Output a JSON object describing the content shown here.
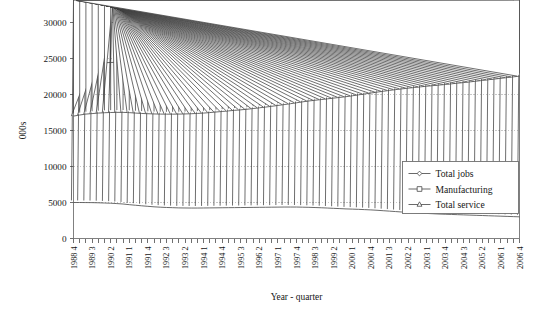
{
  "chart_data": {
    "type": "line",
    "title": "",
    "xlabel": "Year - quarter",
    "ylabel": "000s",
    "ylim": [
      0,
      30000
    ],
    "yticks": [
      0,
      5000,
      10000,
      15000,
      20000,
      25000,
      30000
    ],
    "ytick_labels": [
      "0",
      "5000",
      "10000",
      "15000",
      "20000",
      "25000",
      "30000"
    ],
    "grid": true,
    "legend_position": "center-right",
    "x": [
      "1988 4",
      "1989 1",
      "1989 2",
      "1989 3",
      "1989 4",
      "1990 1",
      "1990 2",
      "1990 3",
      "1990 4",
      "1991 1",
      "1991 2",
      "1991 3",
      "1991 4",
      "1992 1",
      "1992 2",
      "1992 3",
      "1992 4",
      "1993 1",
      "1993 2",
      "1993 3",
      "1993 4",
      "1994 1",
      "1994 2",
      "1994 3",
      "1994 4",
      "1995 1",
      "1995 2",
      "1995 3",
      "1995 4",
      "1996 1",
      "1996 2",
      "1996 3",
      "1996 4",
      "1997 1",
      "1997 2",
      "1997 3",
      "1997 4",
      "1998 1",
      "1998 2",
      "1998 3",
      "1998 4",
      "1999 1",
      "1999 2",
      "1999 3",
      "1999 4",
      "2000 1",
      "2000 2",
      "2000 3",
      "2000 4",
      "2001 1",
      "2001 2",
      "2001 3",
      "2001 4",
      "2002 1",
      "2002 2",
      "2002 3",
      "2002 4",
      "2003 1",
      "2003 2",
      "2003 3",
      "2003 4",
      "2004 1",
      "2004 2",
      "2004 3",
      "2004 4",
      "2005 1",
      "2005 2",
      "2005 3",
      "2005 4",
      "2006 1",
      "2006 2",
      "2006 3",
      "2006 4"
    ],
    "xtick_labels": [
      "1988 4",
      "1989 3",
      "1990 2",
      "1991 1",
      "1991 4",
      "1992 3",
      "1993 2",
      "1994 1",
      "1994 4",
      "1995 3",
      "1996 2",
      "1997 1",
      "1997 4",
      "1998 3",
      "1999 2",
      "2000 1",
      "2000 4",
      "2001 3",
      "2002 2",
      "2003 1",
      "2003 4",
      "2004 3",
      "2005 2",
      "2006 1",
      "2006 4"
    ],
    "xtick_indices": [
      0,
      3,
      6,
      9,
      12,
      15,
      18,
      21,
      24,
      27,
      30,
      33,
      36,
      39,
      42,
      45,
      48,
      51,
      54,
      57,
      60,
      63,
      66,
      69,
      72
    ],
    "series": [
      {
        "name": "Total jobs",
        "marker": "diamond",
        "values": [
          23900,
          24050,
          24180,
          24270,
          24330,
          24400,
          24450,
          24470,
          24430,
          24330,
          24150,
          23950,
          23750,
          23550,
          23380,
          23230,
          23130,
          23050,
          23030,
          23060,
          23100,
          23150,
          23220,
          23300,
          23350,
          23400,
          23450,
          23480,
          23520,
          23580,
          23650,
          23720,
          23800,
          23900,
          24030,
          24150,
          24280,
          24400,
          24500,
          24580,
          24650,
          24700,
          24760,
          24820,
          24900,
          25000,
          25120,
          25230,
          25350,
          25480,
          25600,
          25720,
          25820,
          25900,
          25980,
          26050,
          26120,
          26180,
          26230,
          26280,
          26330,
          26400,
          26480,
          26570,
          26650,
          26750,
          26850,
          26950,
          27050,
          27150,
          27250,
          27350,
          27450
        ]
      },
      {
        "name": "Manufacturing",
        "marker": "square",
        "values": [
          5000,
          5000,
          4990,
          4980,
          4960,
          4930,
          4900,
          4850,
          4790,
          4700,
          4620,
          4540,
          4470,
          4400,
          4350,
          4310,
          4280,
          4250,
          4240,
          4230,
          4230,
          4240,
          4250,
          4260,
          4270,
          4280,
          4290,
          4300,
          4310,
          4320,
          4330,
          4340,
          4350,
          4360,
          4370,
          4370,
          4370,
          4350,
          4330,
          4300,
          4270,
          4230,
          4190,
          4150,
          4110,
          4080,
          4050,
          4010,
          3970,
          3920,
          3860,
          3800,
          3740,
          3680,
          3620,
          3570,
          3530,
          3480,
          3440,
          3400,
          3370,
          3340,
          3310,
          3280,
          3250,
          3220,
          3190,
          3160,
          3130,
          3100,
          3070,
          3040,
          3010
        ]
      },
      {
        "name": "Total service",
        "marker": "triangle",
        "values": [
          17000,
          17150,
          17280,
          17350,
          17420,
          17470,
          17500,
          17520,
          17520,
          17480,
          17420,
          17370,
          17330,
          17300,
          17280,
          17270,
          17270,
          17280,
          17300,
          17330,
          17370,
          17420,
          17490,
          17570,
          17640,
          17720,
          17800,
          17870,
          17950,
          18050,
          18150,
          18250,
          18360,
          18480,
          18600,
          18720,
          18850,
          18980,
          19100,
          19200,
          19300,
          19400,
          19500,
          19600,
          19700,
          19820,
          19950,
          20070,
          20200,
          20330,
          20450,
          20570,
          20680,
          20780,
          20880,
          20970,
          21060,
          21150,
          21230,
          21310,
          21390,
          21480,
          21570,
          21660,
          21750,
          21850,
          21950,
          22050,
          22150,
          22250,
          22350,
          22450,
          22550
        ]
      }
    ]
  },
  "legend": {
    "entries": [
      {
        "label": "Total jobs",
        "marker": "diamond-marker"
      },
      {
        "label": "Manufacturing",
        "marker": "square-marker"
      },
      {
        "label": "Total service",
        "marker": "triangle-marker"
      }
    ]
  },
  "colors": {
    "line": "#4f4f4f",
    "marker_fill": "#ffffff",
    "marker_stroke": "#3d3d3d",
    "grid": "#b9b9b9",
    "axis": "#808080",
    "text": "#161616",
    "background": "#ffffff"
  }
}
